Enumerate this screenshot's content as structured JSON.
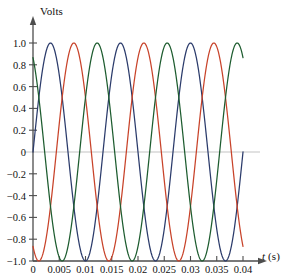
{
  "chart_data": {
    "type": "line",
    "title": "",
    "subtitle": "",
    "xlabel": "t (s)",
    "ylabel": "Volts",
    "xlim": [
      0,
      0.0405
    ],
    "ylim": [
      -1.0,
      1.05
    ],
    "grid": false,
    "legend": "none",
    "zero_line": true,
    "zero_line_color": "#b4b4b4",
    "axis_color": "#4d4d4d",
    "background": "#ffffff",
    "xticks": [
      0,
      0.005,
      0.01,
      0.015,
      0.02,
      0.025,
      0.03,
      0.035,
      0.04
    ],
    "xtick_labels": [
      "0",
      "0.005",
      "0.01",
      "0.015",
      "0.02",
      "0.025",
      "0.03",
      "0.035",
      "0.04"
    ],
    "yticks": [
      1.0,
      0.8,
      0.6,
      0.4,
      0.2,
      0,
      -0.2,
      -0.4,
      -0.6,
      -0.8,
      -1.0
    ],
    "ytick_labels": [
      "1.0",
      "0.8",
      "0.6",
      "0.4",
      "0.2",
      "0",
      "−0.2",
      "−0.4",
      "−0.6",
      "−0.8",
      "−1.0"
    ],
    "amplitude": 1.0,
    "period_s": 0.013333,
    "frequency_hz": 75,
    "series": [
      {
        "name": "phase-a",
        "color": "#2b3b6b",
        "amplitude": 1.0,
        "period_s": 0.013333,
        "phase_deg": 0,
        "formula": "sin(2*pi*t/0.013333)",
        "value_at_t0": 0.0,
        "value_at_tmax": 0.57,
        "peak_times_s": [
          0.00333,
          0.01667,
          0.03
        ],
        "trough_times_s": [
          0.01,
          0.02333,
          0.03667
        ]
      },
      {
        "name": "phase-b",
        "color": "#c8432a",
        "amplitude": 1.0,
        "period_s": 0.013333,
        "phase_deg": -120,
        "formula": "sin(2*pi*t/0.013333 - 2*pi/3)",
        "value_at_t0": -0.866,
        "value_at_tmax": 0.43,
        "peak_times_s": [
          0.00778,
          0.02111,
          0.03444
        ],
        "trough_times_s": [
          0.00111,
          0.01444,
          0.02778
        ]
      },
      {
        "name": "phase-c",
        "color": "#1d5c2f",
        "amplitude": 1.0,
        "period_s": 0.013333,
        "phase_deg": 120,
        "formula": "sin(2*pi*t/0.013333 + 2*pi/3)",
        "value_at_t0": 0.866,
        "value_at_tmax": -1.0,
        "peak_times_s": [
          0.01222,
          0.02556,
          0.03889
        ],
        "trough_times_s": [
          0.00556,
          0.01889,
          0.03222
        ]
      }
    ]
  }
}
